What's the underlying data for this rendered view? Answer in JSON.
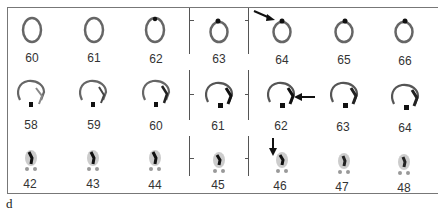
{
  "figure": {
    "panel_label": "d",
    "rows": [
      {
        "view": "axial",
        "slices": [
          "60",
          "61",
          "62",
          "63",
          "64",
          "65",
          "66"
        ]
      },
      {
        "view": "sagittal",
        "slices": [
          "58",
          "59",
          "60",
          "61",
          "62",
          "63",
          "64"
        ]
      },
      {
        "view": "coronal",
        "slices": [
          "42",
          "43",
          "44",
          "45",
          "46",
          "47",
          "48"
        ]
      }
    ],
    "arrows": [
      {
        "row": 0,
        "slice": "64",
        "direction": "down-right"
      },
      {
        "row": 1,
        "slice": "62",
        "direction": "left"
      },
      {
        "row": 2,
        "slice": "46",
        "direction": "down"
      }
    ],
    "colors": {
      "background": "#ffffff",
      "scan": "#555555",
      "hotspot": "#111111",
      "frame": "#777777"
    }
  }
}
